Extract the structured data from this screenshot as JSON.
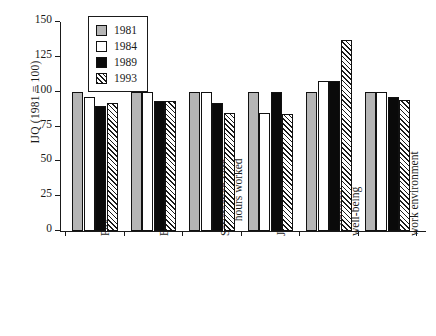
{
  "chart_data": {
    "type": "bar",
    "title": "",
    "xlabel": "",
    "ylabel": "IJQ (1981 = 100)",
    "ylim": [
      0,
      150
    ],
    "yticks": [
      0,
      25,
      50,
      75,
      100,
      125,
      150
    ],
    "ytick_labels": [
      "0",
      "25",
      "50",
      "75",
      "100",
      "125",
      "150"
    ],
    "grid": false,
    "legend_position": "top-left-inside",
    "categories": [
      "Pay",
      "Benefits",
      "Satisfaction with\nhours worked",
      "Job security",
      "Physical\nwell-being",
      "Human/social/\nwork environment"
    ],
    "series": [
      {
        "name": "1981",
        "color": "#b5b5b5",
        "fill": "solid-gray",
        "values": [
          100,
          100,
          100,
          100,
          100,
          100
        ]
      },
      {
        "name": "1984",
        "color": "#ffffff",
        "fill": "solid-white",
        "values": [
          96,
          100,
          100,
          85,
          108,
          100
        ]
      },
      {
        "name": "1989",
        "color": "#0a0a0a",
        "fill": "solid-black",
        "values": [
          90,
          93,
          92,
          100,
          108,
          96
        ]
      },
      {
        "name": "1993",
        "color": "#ffffff",
        "fill": "diagonal-hatch",
        "values": [
          92,
          93,
          85,
          84,
          137,
          94
        ]
      }
    ]
  }
}
